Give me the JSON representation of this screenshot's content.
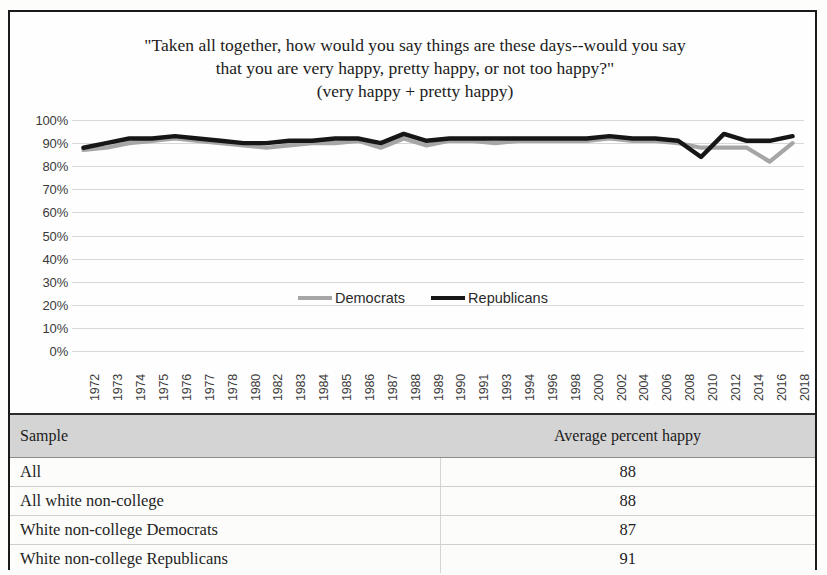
{
  "chart_title": {
    "line1": "\"Taken all together, how would you say things are these days--would you say",
    "line2": "that you are very happy, pretty happy, or not too happy?\"",
    "line3": "(very happy + pretty happy)"
  },
  "legend": {
    "democrats_label": "Democrats",
    "republicans_label": "Republicans",
    "democrats_color": "#a6a6a6",
    "republicans_color": "#161616"
  },
  "table": {
    "headers": [
      "Sample",
      "Average percent happy"
    ],
    "rows": [
      {
        "sample": "All",
        "value": "88"
      },
      {
        "sample": "All white non-college",
        "value": "88"
      },
      {
        "sample": "White non-college Democrats",
        "value": "87"
      },
      {
        "sample": "White non-college Republicans",
        "value": "91"
      }
    ]
  },
  "chart_data": {
    "type": "line",
    "title": "\"Taken all together, how would you say things are these days--would you say that you are very happy, pretty happy, or not too happy?\" (very happy + pretty happy)",
    "xlabel": "",
    "ylabel": "",
    "ylim": [
      0,
      100
    ],
    "ytick_values": [
      0,
      10,
      20,
      30,
      40,
      50,
      60,
      70,
      80,
      90,
      100
    ],
    "ytick_labels": [
      "0%",
      "10%",
      "20%",
      "30%",
      "40%",
      "50%",
      "60%",
      "70%",
      "80%",
      "90%",
      "100%"
    ],
    "grid": true,
    "legend_position": "center-inside",
    "categories": [
      "1972",
      "1973",
      "1974",
      "1975",
      "1976",
      "1977",
      "1978",
      "1980",
      "1982",
      "1983",
      "1984",
      "1985",
      "1986",
      "1987",
      "1988",
      "1989",
      "1990",
      "1991",
      "1993",
      "1994",
      "1996",
      "1998",
      "2000",
      "2002",
      "2004",
      "2006",
      "2008",
      "2010",
      "2012",
      "2014",
      "2016",
      "2018"
    ],
    "series": [
      {
        "name": "Democrats",
        "color": "#a6a6a6",
        "values": [
          87,
          88,
          90,
          91,
          92,
          91,
          90,
          89,
          88,
          89,
          90,
          90,
          91,
          88,
          92,
          89,
          91,
          91,
          90,
          91,
          91,
          91,
          91,
          92,
          91,
          91,
          90,
          88,
          88,
          88,
          82,
          90
        ]
      },
      {
        "name": "Republicans",
        "color": "#161616",
        "values": [
          88,
          90,
          92,
          92,
          93,
          92,
          91,
          90,
          90,
          91,
          91,
          92,
          92,
          90,
          94,
          91,
          92,
          92,
          92,
          92,
          92,
          92,
          92,
          93,
          92,
          92,
          91,
          84,
          94,
          91,
          91,
          93
        ]
      }
    ]
  }
}
